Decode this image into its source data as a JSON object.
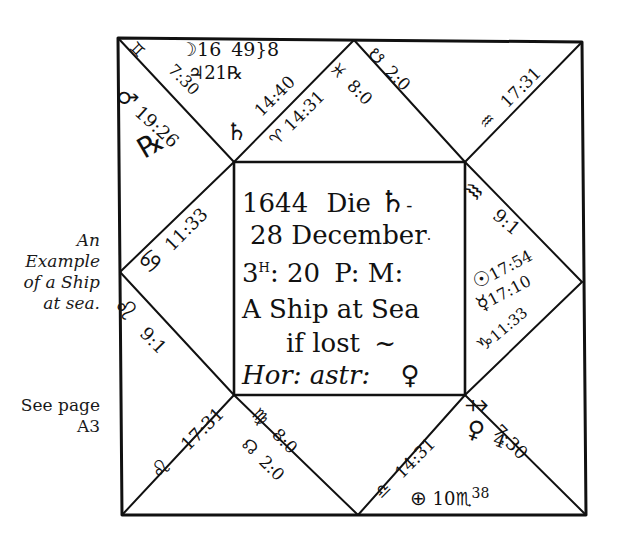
{
  "margin_note": {
    "caption_lines": [
      "An",
      "Example",
      "of a Ship",
      "at sea."
    ],
    "reference_lines": [
      "See page",
      "A3"
    ]
  },
  "center": {
    "line1_year": "1644",
    "line1_die": "Die",
    "line1_weekday_symbol": "♄",
    "line2_day": "28",
    "line2_month": "December",
    "line3_hour": "3",
    "line3_hour_sup": "H",
    "line3_minutes": ": 20",
    "line3_pm": "P: M:",
    "line4": "A Ship at Sea",
    "line5": "if lost",
    "line5_tail": "~",
    "line6_label": "Hor: astr:",
    "line6_symbol": "♀"
  },
  "houses": {
    "top_left_triangle": {
      "cusp_sign": "♊",
      "cusp_degree": "7:30",
      "planets": [
        {
          "symbol": "☽",
          "text": "16"
        },
        {
          "symbol": "",
          "text": "49"
        },
        {
          "symbol": "♃",
          "text": "21"
        },
        {
          "symbol": "℞",
          "text": ""
        },
        {
          "symbol": "",
          "text": "8"
        }
      ]
    },
    "house_12_top": {
      "cusp_sign": "♈",
      "cusp_degree": "14:31",
      "planet_symbol": "♄",
      "planet_degree": "14:40"
    },
    "house_upper_left_outer": {
      "planet_symbol": "♂",
      "planet_degree": "19:26",
      "extra_symbol": "℞"
    },
    "house_11_top": {
      "cusp_sign": "♓",
      "cusp_degree": "8:0",
      "planet_symbol": "☋",
      "planet_degree": "2:0"
    },
    "house_10_top_right": {
      "cusp_sign": "♒",
      "cusp_degree": "17:31"
    },
    "house_9_right": {
      "cusp_sign": "♒",
      "cusp_degree": "9:1"
    },
    "house_8_right": {
      "planets": [
        {
          "symbol": "☉",
          "degree": "17:54"
        },
        {
          "symbol": "☿",
          "degree": "17:10"
        },
        {
          "symbol": "",
          "degree": "11:33"
        }
      ],
      "cusp_sign": "♑"
    },
    "house_1_left": {
      "cusp_sign": "♋",
      "cusp_degree": "11:33"
    },
    "house_2_left": {
      "cusp_sign": "♌",
      "cusp_degree": "9:1"
    },
    "house_3_bottom_left": {
      "cusp_sign": "♌",
      "cusp_degree": "17:31"
    },
    "house_4_bottom": {
      "cusp_sign": "♍",
      "cusp_degree": "8:0",
      "planet_symbol": "☊",
      "planet_degree": "2:0"
    },
    "house_5_bottom": {
      "cusp_sign": "♎",
      "cusp_degree": "14:31",
      "planets": [
        {
          "symbol": "♀",
          "degree": "4"
        },
        {
          "symbol": "⊕",
          "degree": "10"
        }
      ],
      "extra_sign": "♏",
      "extra_degree": "38"
    },
    "house_6_bottom_right": {
      "cusp_sign": "♐",
      "cusp_degree": "7:30"
    }
  },
  "colors": {
    "ink": "#111111",
    "paper": "#ffffff",
    "note_text": "#1a1a1a"
  }
}
